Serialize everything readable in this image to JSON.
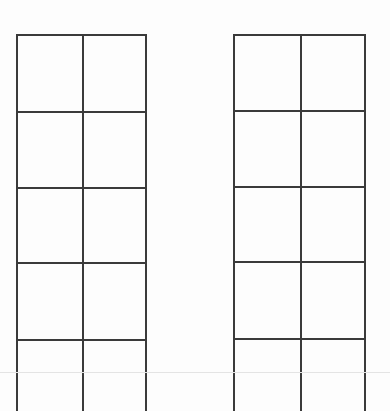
{
  "diagram": {
    "line_color": "#3a3a3a",
    "background": "#fdfdfd",
    "grids": [
      {
        "name": "left-grid",
        "columns": 2,
        "x": [
          16,
          82,
          145
        ],
        "rows_y": [
          34,
          111,
          187,
          262,
          339
        ],
        "bottom": 411
      },
      {
        "name": "right-grid",
        "columns": 2,
        "x": [
          233,
          300,
          364
        ],
        "rows_y": [
          34,
          110,
          186,
          261,
          338
        ],
        "bottom": 411
      }
    ],
    "faint_line_y": 372
  }
}
